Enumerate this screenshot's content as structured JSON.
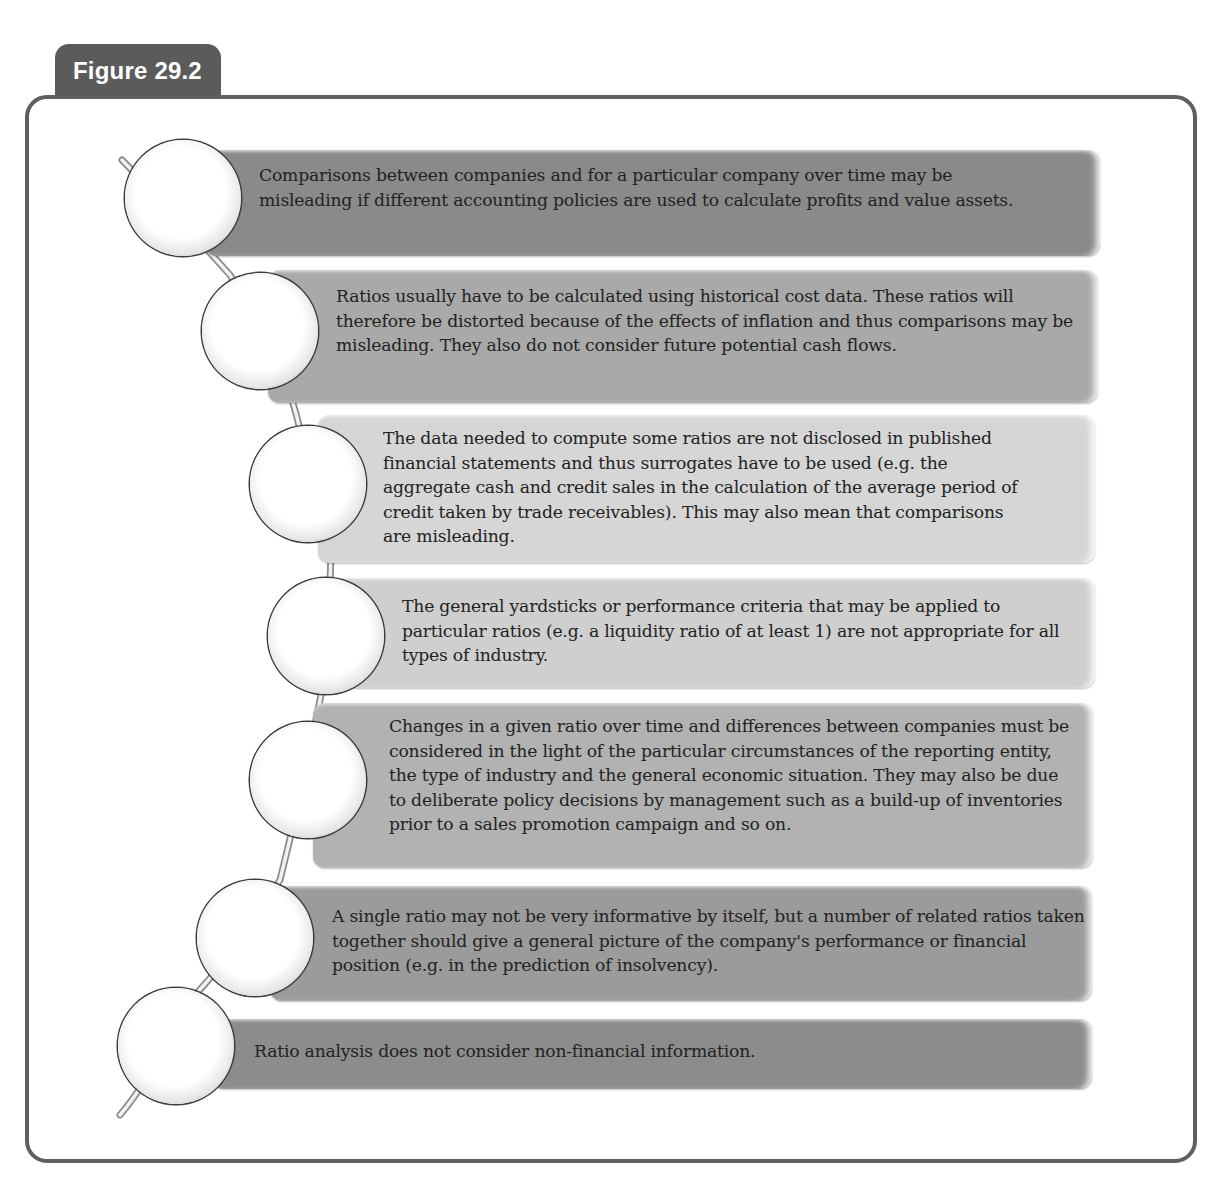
{
  "figure": {
    "label": "Figure 29.2"
  },
  "items": [
    {
      "text": "Comparisons between companies and for a particular company over time may be misleading if different accounting policies are used to calculate profits and value assets.",
      "color": "#8a8a8a"
    },
    {
      "text": "Ratios usually have to be calculated using historical cost data. These ratios will therefore be distorted because of the effects of inflation and thus comparisons may be misleading. They also do not consider future potential cash flows.",
      "color": "#a9a9a9"
    },
    {
      "text": "The data needed to compute some ratios are not disclosed in published financial statements and thus surrogates have to be used (e.g. the aggregate cash and credit sales in the calculation of the average period of credit taken by trade receivables). This may also mean that comparisons are misleading.",
      "color": "#d6d6d6"
    },
    {
      "text": "The general yardsticks or performance criteria that may be applied to particular ratios (e.g. a liquidity ratio of at least 1) are not appropriate for all types of industry.",
      "color": "#cfcfcf"
    },
    {
      "text": "Changes in a given ratio over time and differences between companies must be considered in the light of the particular circumstances of the reporting entity, the type of industry and the general economic situation. They may also be due to deliberate policy decisions by management such as a build-up of inventories prior to a sales promotion campaign and so on.",
      "color": "#b2b2b2"
    },
    {
      "text": "A single ratio may not be very informative by itself, but a number of related ratios taken together should give a general picture of the company's performance or financial position (e.g. in the prediction of insolvency).",
      "color": "#9b9b9b"
    },
    {
      "text": "Ratio analysis does not consider non-financial information.",
      "color": "#8c8c8c"
    }
  ]
}
